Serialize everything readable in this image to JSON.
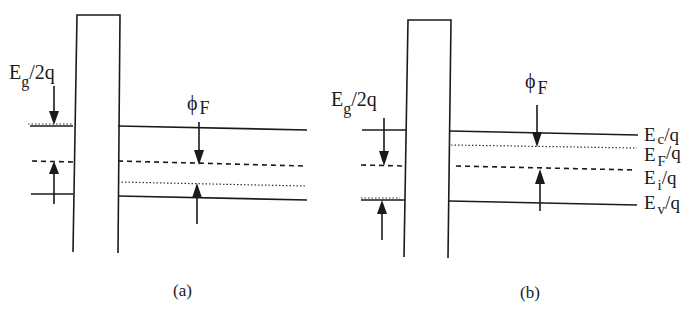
{
  "figure": {
    "panels": [
      {
        "id": "a",
        "caption": "(a)",
        "left_label": {
          "main": "E",
          "sub": "g",
          "tail": "/2q"
        },
        "right_label": {
          "main": "ϕ",
          "sub": "F"
        },
        "description": "p-type: Fermi level below intrinsic level"
      },
      {
        "id": "b",
        "caption": "(b)",
        "left_label": {
          "main": "E",
          "sub": "g",
          "tail": "/2q"
        },
        "right_label": {
          "main": "ϕ",
          "sub": "F"
        },
        "level_labels": [
          {
            "main": "E",
            "sub": "c",
            "tail": "/q"
          },
          {
            "main": "E",
            "sub": "F",
            "tail": "/q"
          },
          {
            "main": "E",
            "sub": "i",
            "tail": "/q"
          },
          {
            "main": "E",
            "sub": "v",
            "tail": "/q"
          }
        ],
        "description": "n-type: Fermi level above intrinsic level"
      }
    ],
    "colors": {
      "ink": "#1a1a1a",
      "background": "#ffffff"
    }
  }
}
